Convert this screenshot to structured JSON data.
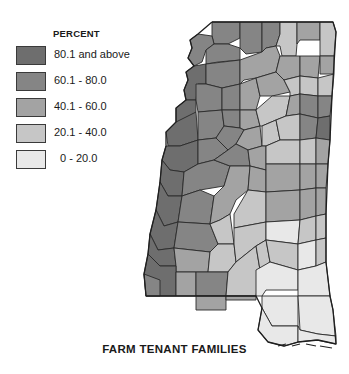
{
  "legend": {
    "title": "PERCENT",
    "classes": [
      {
        "label": "80.1 and above",
        "range": [
          80.1,
          100
        ],
        "color": "#6e6e6e"
      },
      {
        "label": "60.1 - 80.0",
        "range": [
          60.1,
          80.0
        ],
        "color": "#858585"
      },
      {
        "label": "40.1 - 60.0",
        "range": [
          40.1,
          60.0
        ],
        "color": "#a3a3a3"
      },
      {
        "label": "20.1 - 40.0",
        "range": [
          20.1,
          40.0
        ],
        "color": "#c6c6c6"
      },
      {
        "label": "  0 - 20.0",
        "range": [
          0,
          20.0
        ],
        "color": "#e8e8e8"
      }
    ]
  },
  "map": {
    "region": "Mississippi",
    "subject": "Farm tenant families by county",
    "border_color": "#2a2a2a"
  },
  "caption": "FARM TENANT FAMILIES"
}
